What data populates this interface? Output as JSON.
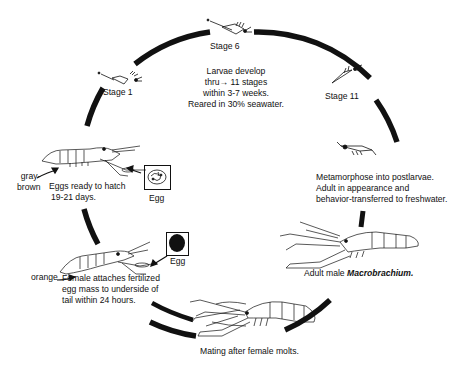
{
  "diagram": {
    "stages": {
      "stage6": "Stage 6",
      "stage1": "Stage 1",
      "stage11": "Stage 11"
    },
    "center_text": {
      "line1": "Larvae develop",
      "line2": "thru→ 11 stages",
      "line3": "within 3-7 weeks.",
      "line4": "Reared in 30% seawater."
    },
    "postlarvae_text": {
      "line1": "Metamorphose into postlarvae.",
      "line2": "Adult in appearance and",
      "line3": "behavior-transferred to freshwater."
    },
    "adult_male": {
      "prefix": "Adult male ",
      "species": "Macrobrachium."
    },
    "mating_text": "Mating after female molts.",
    "attach_text": {
      "line1": "Female attaches fertilized",
      "line2": "egg mass to underside of",
      "line3": "tail within 24 hours."
    },
    "hatch_text": {
      "line1": "Eggs ready to hatch",
      "line2": "19-21 days."
    },
    "color_labels": {
      "gray_brown_1": "gray-",
      "gray_brown_2": "brown",
      "orange": "orange"
    },
    "egg_labels": {
      "developed": "Egg",
      "fresh": "Egg"
    },
    "colors": {
      "ink": "#111111",
      "background": "#ffffff"
    }
  }
}
